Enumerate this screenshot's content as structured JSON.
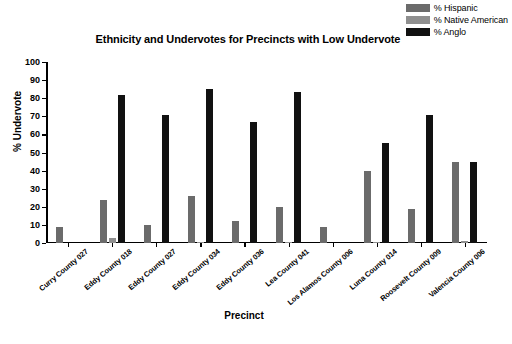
{
  "chart_data": {
    "type": "bar",
    "title": "Ethnicity and Undervotes for Precincts with Low Undervote",
    "xlabel": "Precinct",
    "ylabel": "% Undervote",
    "ylim": [
      0,
      100
    ],
    "ytick_step": 10,
    "yticks": [
      "100",
      "90",
      "80",
      "70",
      "60",
      "50",
      "40",
      "30",
      "20",
      "10",
      "0"
    ],
    "grid": false,
    "legend_position": "top-right",
    "categories": [
      "Curry County 027",
      "Eddy County 018",
      "Eddy County 027",
      "Eddy County 034",
      "Eddy County 036",
      "Lea County 041",
      "Los Alamos County 006",
      "Luna County 014",
      "Roosevelt County 009",
      "Valencia County 006"
    ],
    "series": [
      {
        "name": "% Hispanic",
        "color": "#6b6b6b",
        "values": [
          9,
          24,
          10,
          26,
          12,
          20,
          9,
          40,
          19,
          45
        ]
      },
      {
        "name": "% Native American",
        "color": "#8f8f8f",
        "values": [
          0,
          2.5,
          0,
          0.8,
          0,
          0.6,
          0,
          0.5,
          0,
          1.2
        ]
      },
      {
        "name": "% Anglo",
        "color": "#111111",
        "values": [
          0,
          82,
          71,
          85,
          67,
          83.5,
          0,
          55,
          71,
          45
        ]
      }
    ]
  }
}
